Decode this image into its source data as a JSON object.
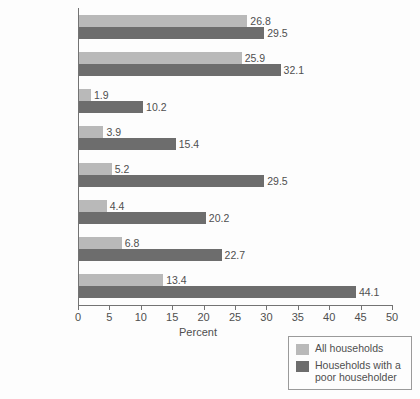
{
  "chart_data": {
    "type": "bar",
    "orientation": "horizontal",
    "title": "",
    "xlabel": "Percent",
    "ylabel": "",
    "xlim": [
      0,
      50
    ],
    "xticks": [
      0,
      5,
      10,
      15,
      20,
      25,
      30,
      35,
      40,
      45,
      50
    ],
    "grid": false,
    "legend_position": "bottom-right",
    "categories": [
      "Social\nSecurity",
      "Medicare",
      "TANF/General\nAssistance",
      "Supplemental\nSecurity Income",
      "Food\nstamps",
      "Housing\nassistance",
      "Free/\nreduced-priced\nschool lunches",
      "Medicaid"
    ],
    "series": [
      {
        "name": "All households",
        "color": "#b9b9b9",
        "values": [
          26.8,
          25.9,
          1.9,
          3.9,
          5.2,
          4.4,
          6.8,
          13.4
        ],
        "labels": [
          "26.8",
          "25.9",
          "1.9",
          "3.9",
          "5.2",
          "4.4",
          "6.8",
          "13.4"
        ]
      },
      {
        "name": "Households with a poor householder",
        "color": "#6d6d6d",
        "values": [
          29.5,
          32.1,
          10.2,
          15.4,
          29.5,
          20.2,
          22.7,
          44.1
        ],
        "labels": [
          "29.5",
          "32.1",
          "10.2",
          "15.4",
          "29.5",
          "20.2",
          "22.7",
          "44.1"
        ]
      }
    ]
  },
  "axis": {
    "x_title": "Percent",
    "tick_labels": [
      "0",
      "5",
      "10",
      "15",
      "20",
      "25",
      "30",
      "35",
      "40",
      "45",
      "50"
    ]
  },
  "legend": {
    "items": [
      {
        "label": "All households",
        "swatch": "light-gray-swatch"
      },
      {
        "label": "Households with a\npoor householder",
        "swatch": "dark-gray-swatch"
      }
    ]
  }
}
